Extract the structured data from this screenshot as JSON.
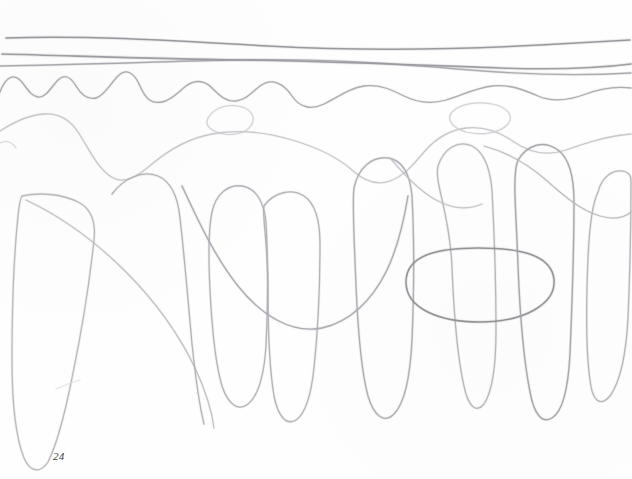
{
  "page": {
    "background_color": "#fefefe",
    "width": 632,
    "height": 479,
    "page_number": "24",
    "page_number_color": "#3a3a3a",
    "medium": "graphite pencil on white paper"
  },
  "drawing": {
    "description": "Faint freehand graphite pencil studies of waves and drapery-like hanging loops",
    "stroke_color_dark": "#7c7c80",
    "stroke_color_mid": "#a9a9ae",
    "stroke_color_light": "#c8c8cd",
    "stroke_color_faint": "#dcdce0",
    "strokes": [
      {
        "name": "horizon-line-1",
        "kind": "near-horizontal",
        "color": "#8b8b90",
        "width": 1.5,
        "opacity": 0.85,
        "path": "M 6,38 C 90,35 180,41 268,46 C 360,51 450,50 540,45 C 580,43 610,41 630,40"
      },
      {
        "name": "horizon-line-2",
        "kind": "near-horizontal",
        "color": "#8f8f95",
        "width": 1.6,
        "opacity": 0.85,
        "path": "M 2,54 C 80,56 160,59 240,60 C 330,61 420,65 500,68 C 556,70 600,68 631,64"
      },
      {
        "name": "horizon-line-3",
        "kind": "near-horizontal",
        "color": "#9a9aa0",
        "width": 1.4,
        "opacity": 0.8,
        "path": "M 0,66 C 70,65 150,62 230,60 C 320,58 400,64 470,70 C 530,75 580,76 631,73"
      },
      {
        "name": "wave-line-high-frequency",
        "kind": "wavy",
        "color": "#a0a0a6",
        "width": 1.3,
        "opacity": 0.85,
        "path": "M 0,92 C 6,76 14,74 20,80 C 26,86 30,96 38,97 C 46,98 52,86 58,80 C 64,74 70,76 76,86 C 82,96 88,100 96,98 C 104,96 110,84 118,76 C 126,68 134,72 140,86 C 146,100 152,104 162,102 C 172,100 178,92 186,86 C 196,79 204,80 212,88 C 220,96 226,102 236,101 C 246,100 252,92 260,86 C 272,77 284,84 292,96 C 300,108 312,110 324,104 C 340,96 350,88 364,86 C 380,84 392,90 404,96 C 418,103 432,104 446,100 C 462,95 476,88 492,86 C 510,84 524,90 538,96 C 554,103 570,100 586,94 C 602,88 616,86 631,88"
      },
      {
        "name": "wave-line-broad-upper",
        "kind": "wavy",
        "color": "#c4c4c9",
        "width": 1.3,
        "opacity": 0.9,
        "path": "M 0,131 C 14,122 28,115 44,114 C 60,113 70,120 78,132 C 88,147 96,166 110,176 C 124,186 138,176 152,164 C 170,149 190,138 212,134 C 240,129 266,132 292,140 C 316,147 336,156 352,170 C 364,181 376,186 390,181 C 404,176 414,164 424,152 C 436,138 450,130 466,128 C 484,126 500,132 514,142 C 530,153 548,156 566,150 C 586,143 606,136 631,134"
      },
      {
        "name": "small-loop-top-center",
        "kind": "closed-loop",
        "color": "#cfcfd4",
        "width": 1.2,
        "opacity": 0.9,
        "path": "M 208,118 C 214,108 226,104 238,106 C 250,108 256,116 252,124 C 248,132 236,136 224,134 C 212,132 204,126 208,118"
      },
      {
        "name": "small-loop-top-right",
        "kind": "closed-loop",
        "color": "#cfcfd4",
        "width": 1.2,
        "opacity": 0.9,
        "path": "M 452,112 C 460,104 476,101 492,104 C 508,107 514,116 508,124 C 500,133 482,136 466,132 C 452,128 446,119 452,112"
      },
      {
        "name": "hanging-loop-far-left",
        "kind": "hanging-loop",
        "color": "#b6b6bc",
        "width": 1.3,
        "opacity": 0.95,
        "path": "M 22,196 C 40,192 62,194 78,202 C 92,209 96,222 94,240 C 90,278 82,330 72,378 C 64,418 56,446 48,462 C 40,474 30,472 24,458 C 16,438 12,402 12,360 C 12,312 14,254 18,216 C 19,206 20,199 22,196"
      },
      {
        "name": "drape-left-diagonal",
        "kind": "open-curve",
        "color": "#bcbcc2",
        "width": 1.2,
        "opacity": 0.92,
        "path": "M 26,200 C 60,216 96,242 126,272 C 156,302 180,336 196,370 C 206,392 212,412 214,428"
      },
      {
        "name": "hanging-loop-1",
        "kind": "hanging-loop",
        "color": "#b0b0b6",
        "width": 1.3,
        "opacity": 0.95,
        "path": "M 112,194 C 124,178 142,170 158,176 C 172,182 178,198 180,218 C 184,252 188,300 192,344 C 196,382 200,408 204,424"
      },
      {
        "name": "hanging-loop-2-u",
        "kind": "hanging-loop",
        "color": "#b0b0b6",
        "width": 1.3,
        "opacity": 0.95,
        "path": "M 212,212 C 216,194 228,184 242,186 C 256,188 264,202 266,222 C 268,258 268,306 266,346 C 264,376 258,396 248,404 C 238,412 228,404 222,386 C 216,366 212,330 210,290 C 208,250 209,226 212,212"
      },
      {
        "name": "big-swoop-midleft",
        "kind": "open-curve",
        "color": "#a8a8ae",
        "width": 1.4,
        "opacity": 0.95,
        "path": "M 182,186 C 196,216 214,256 238,286 C 262,316 292,334 322,328 C 350,322 372,300 386,272 C 398,248 404,220 408,196"
      },
      {
        "name": "hanging-loop-3",
        "kind": "hanging-loop",
        "color": "#b0b0b6",
        "width": 1.3,
        "opacity": 0.95,
        "path": "M 264,206 C 274,192 292,188 304,196 C 316,204 320,222 320,244 C 320,284 318,330 314,368 C 311,396 305,414 296,420 C 286,426 278,416 274,396 C 270,372 268,332 268,290 C 268,242 262,218 264,206"
      },
      {
        "name": "hanging-loop-4-tall",
        "kind": "hanging-loop",
        "color": "#acacb2",
        "width": 1.4,
        "opacity": 0.95,
        "path": "M 354,188 C 358,168 372,156 388,158 C 402,160 410,174 412,196 C 414,234 414,292 412,340 C 410,380 404,404 394,414 C 384,424 374,416 368,396 C 362,374 358,332 356,286 C 354,234 352,202 354,188"
      },
      {
        "name": "hanging-loop-5",
        "kind": "hanging-loop",
        "color": "#b4b4ba",
        "width": 1.3,
        "opacity": 0.95,
        "path": "M 438,166 C 444,148 458,140 472,146 C 484,152 490,168 492,190 C 494,228 496,286 496,330 C 496,366 492,392 484,404 C 476,414 468,406 464,386 C 458,360 454,316 452,268 C 450,212 434,184 438,166"
      },
      {
        "name": "big-ellipse-center-right",
        "kind": "closed-ellipse",
        "color": "#8e8e94",
        "width": 1.5,
        "opacity": 0.95,
        "path": "M 406,282 C 406,254 440,248 478,248 C 518,248 552,254 554,280 C 556,304 524,322 480,322 C 438,322 406,308 406,282"
      },
      {
        "name": "hanging-loop-6",
        "kind": "hanging-loop",
        "color": "#a4a4aa",
        "width": 1.4,
        "opacity": 0.95,
        "path": "M 518,160 C 528,144 544,140 558,150 C 570,159 574,178 574,202 C 574,244 572,306 570,354 C 568,392 562,412 552,418 C 542,424 534,414 530,392 C 524,362 520,316 518,266 C 516,206 512,176 518,160"
      },
      {
        "name": "hanging-loop-7-right-edge",
        "kind": "hanging-loop",
        "color": "#b2b2b8",
        "width": 1.3,
        "opacity": 0.95,
        "path": "M 598,192 C 602,176 614,168 626,172 C 631,174 631,178 631,184 C 631,216 630,272 628,318 C 626,356 620,382 610,396 C 600,408 592,400 590,380 C 586,352 586,306 588,258 C 590,214 594,200 598,192"
      },
      {
        "name": "arc-link-right",
        "kind": "open-curve",
        "color": "#b8b8be",
        "width": 1.2,
        "opacity": 0.9,
        "path": "M 484,146 C 506,152 528,164 546,180 C 564,196 580,210 600,216 C 614,220 624,218 631,212"
      },
      {
        "name": "arc-link-center",
        "kind": "open-curve",
        "color": "#c0c0c6",
        "width": 1.2,
        "opacity": 0.88,
        "path": "M 390,158 C 404,174 418,190 436,200 C 452,209 468,210 482,204"
      },
      {
        "name": "faint-left-edge-mark",
        "kind": "short-mark",
        "color": "#d6d6da",
        "width": 1.1,
        "opacity": 0.85,
        "path": "M 0,143 C 6,140 12,142 16,148"
      },
      {
        "name": "faint-smudge-lowleft",
        "kind": "short-mark",
        "color": "#dedee2",
        "width": 1.0,
        "opacity": 0.8,
        "path": "M 56,389 C 64,386 72,382 80,380"
      }
    ]
  }
}
